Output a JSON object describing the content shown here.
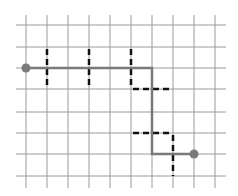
{
  "diagram": {
    "type": "grid-path",
    "grid": {
      "columns_x": [
        26,
        47,
        68,
        89,
        110,
        131,
        152,
        173,
        194,
        215
      ],
      "rows_y": [
        25,
        47,
        68,
        89,
        112,
        133,
        154,
        176
      ],
      "x_extent": [
        16,
        226
      ],
      "y_extent": [
        15,
        188
      ],
      "line_color": "#9a9a9a"
    },
    "path": {
      "color": "#7a7a7a",
      "points": [
        [
          26,
          68
        ],
        [
          152,
          68
        ],
        [
          152,
          154
        ],
        [
          194,
          154
        ]
      ],
      "start_point": [
        26,
        68
      ],
      "end_point": [
        194,
        154
      ]
    },
    "walls": {
      "color": "#111111",
      "segments": [
        [
          [
            47,
            47
          ],
          [
            47,
            89
          ]
        ],
        [
          [
            89,
            47
          ],
          [
            89,
            89
          ]
        ],
        [
          [
            131,
            47
          ],
          [
            131,
            89
          ]
        ],
        [
          [
            131,
            89
          ],
          [
            173,
            89
          ]
        ],
        [
          [
            131,
            133
          ],
          [
            173,
            133
          ]
        ],
        [
          [
            173,
            133
          ],
          [
            173,
            176
          ]
        ]
      ]
    }
  }
}
